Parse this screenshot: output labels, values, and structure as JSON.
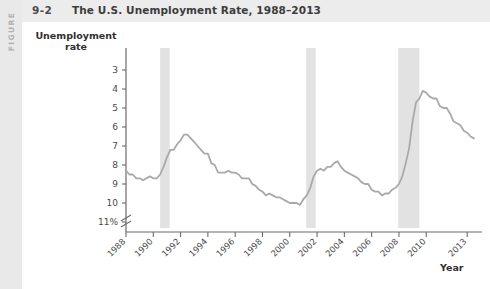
{
  "figure": {
    "rail_label": "FIGURE",
    "number": "9-2",
    "title": "The U.S. Unemployment Rate, 1988–2013"
  },
  "axes": {
    "y_title_line1": "Unemployment",
    "y_title_line2": "rate",
    "x_title": "Year",
    "y_ticks": [
      "11%",
      "10",
      "9",
      "8",
      "7",
      "6",
      "5",
      "4",
      "3"
    ],
    "x_ticks": [
      "1988",
      "1990",
      "1992",
      "1994",
      "1996",
      "1998",
      "2000",
      "2002",
      "2004",
      "2006",
      "2008",
      "2010",
      "2013"
    ],
    "axis_break": true
  },
  "colors": {
    "line": "#a9a9a9",
    "recession_band": "#e2e2e2",
    "axis": "#6b6b6b",
    "rail": "#e9e9e9",
    "header": "#ececec"
  },
  "chart_data": {
    "type": "line",
    "title": "The U.S. Unemployment Rate, 1988–2013",
    "xlabel": "Year",
    "ylabel": "Unemployment rate",
    "ylim": [
      3,
      11
    ],
    "xlim": [
      1988,
      2013.5
    ],
    "grid": false,
    "legend": null,
    "y_unit": "percent",
    "y_ticks": [
      3,
      4,
      5,
      6,
      7,
      8,
      9,
      10,
      11
    ],
    "x_ticks": [
      1988,
      1990,
      1992,
      1994,
      1996,
      1998,
      2000,
      2002,
      2004,
      2006,
      2008,
      2010,
      2013
    ],
    "recessions": [
      {
        "label": "1990–91 recession",
        "start": 1990.5,
        "end": 1991.2
      },
      {
        "label": "2001 recession",
        "start": 2001.2,
        "end": 2001.9
      },
      {
        "label": "2007–09 recession",
        "start": 2007.95,
        "end": 2009.5
      }
    ],
    "series": [
      {
        "name": "U.S. unemployment rate",
        "x": [
          1988.0,
          1988.25,
          1988.5,
          1988.75,
          1989.0,
          1989.25,
          1989.5,
          1989.75,
          1990.0,
          1990.25,
          1990.5,
          1990.75,
          1991.0,
          1991.25,
          1991.5,
          1991.75,
          1992.0,
          1992.25,
          1992.5,
          1992.75,
          1993.0,
          1993.25,
          1993.5,
          1993.75,
          1994.0,
          1994.25,
          1994.5,
          1994.75,
          1995.0,
          1995.25,
          1995.5,
          1995.75,
          1996.0,
          1996.25,
          1996.5,
          1996.75,
          1997.0,
          1997.25,
          1997.5,
          1997.75,
          1998.0,
          1998.25,
          1998.5,
          1998.75,
          1999.0,
          1999.25,
          1999.5,
          1999.75,
          2000.0,
          2000.25,
          2000.5,
          2000.75,
          2001.0,
          2001.25,
          2001.5,
          2001.75,
          2002.0,
          2002.25,
          2002.5,
          2002.75,
          2003.0,
          2003.25,
          2003.5,
          2003.75,
          2004.0,
          2004.25,
          2004.5,
          2004.75,
          2005.0,
          2005.25,
          2005.5,
          2005.75,
          2006.0,
          2006.25,
          2006.5,
          2006.75,
          2007.0,
          2007.25,
          2007.5,
          2007.75,
          2008.0,
          2008.25,
          2008.5,
          2008.75,
          2009.0,
          2009.25,
          2009.5,
          2009.75,
          2010.0,
          2010.25,
          2010.5,
          2010.75,
          2011.0,
          2011.25,
          2011.5,
          2011.75,
          2012.0,
          2012.25,
          2012.5,
          2012.75,
          2013.0,
          2013.25,
          2013.5
        ],
        "values": [
          5.7,
          5.5,
          5.5,
          5.3,
          5.3,
          5.2,
          5.3,
          5.4,
          5.3,
          5.3,
          5.5,
          5.9,
          6.4,
          6.8,
          6.8,
          7.1,
          7.3,
          7.6,
          7.6,
          7.4,
          7.2,
          7.0,
          6.8,
          6.6,
          6.6,
          6.1,
          6.0,
          5.6,
          5.6,
          5.6,
          5.7,
          5.6,
          5.6,
          5.5,
          5.3,
          5.3,
          5.3,
          5.0,
          4.9,
          4.7,
          4.6,
          4.4,
          4.5,
          4.4,
          4.3,
          4.3,
          4.2,
          4.1,
          4.0,
          4.0,
          4.0,
          3.9,
          4.2,
          4.4,
          4.8,
          5.4,
          5.7,
          5.8,
          5.7,
          5.9,
          5.9,
          6.1,
          6.2,
          5.9,
          5.7,
          5.6,
          5.5,
          5.4,
          5.3,
          5.1,
          5.0,
          5.0,
          4.7,
          4.6,
          4.6,
          4.4,
          4.5,
          4.5,
          4.7,
          4.8,
          5.0,
          5.4,
          6.1,
          6.9,
          8.3,
          9.3,
          9.5,
          9.9,
          9.8,
          9.6,
          9.5,
          9.5,
          9.1,
          9.0,
          9.0,
          8.7,
          8.3,
          8.2,
          8.1,
          7.8,
          7.7,
          7.5,
          7.4
        ],
        "color": "#a9a9a9",
        "peak": {
          "year": 2009.8,
          "value": 10.0
        },
        "trough": {
          "year": 2000.75,
          "value": 3.9
        },
        "last_value": 7.4
      }
    ]
  }
}
